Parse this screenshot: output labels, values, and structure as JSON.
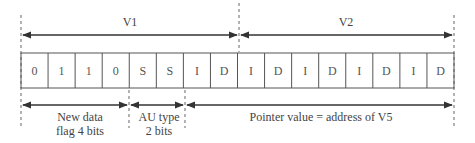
{
  "diagram": {
    "top_labels": [
      {
        "text": "V1",
        "x": 130,
        "y": 10
      },
      {
        "text": "V2",
        "x": 346,
        "y": 10
      }
    ],
    "cells": [
      "0",
      "1",
      "1",
      "0",
      "S",
      "S",
      "I",
      "D",
      "I",
      "D",
      "I",
      "D",
      "I",
      "D",
      "I",
      "D"
    ],
    "bottom_labels": {
      "flag": {
        "line1": "New data",
        "line2": "flag 4 bits"
      },
      "au_type": {
        "line1": "AU type",
        "line2": "2 bits"
      },
      "pointer": {
        "line1": "Pointer value = address of V5"
      }
    },
    "colors": {
      "line": "#444444",
      "dash": "#666666",
      "text": "#444444"
    }
  }
}
